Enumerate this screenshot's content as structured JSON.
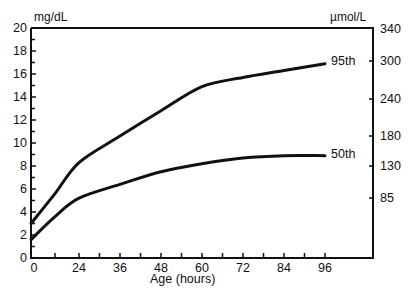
{
  "chart_data": {
    "type": "line",
    "title": "",
    "xlabel": "Age (hours)",
    "ylabel_left": "mg/dL",
    "ylabel_right": "µmol/L",
    "x_ticks": [
      0,
      24,
      36,
      48,
      60,
      72,
      84,
      96
    ],
    "y_ticks_left": [
      0,
      2,
      4,
      6,
      8,
      10,
      12,
      14,
      16,
      18,
      20
    ],
    "y_ticks_right": [
      85,
      130,
      180,
      240,
      300,
      340
    ],
    "ylim": [
      0,
      20
    ],
    "xlim": [
      0,
      96
    ],
    "grid": false,
    "legend": "inline labels at line ends",
    "x": [
      0,
      12,
      24,
      36,
      48,
      60,
      72,
      84,
      96
    ],
    "series": [
      {
        "name": "95th",
        "values": [
          3.0,
          5.6,
          8.3,
          10.6,
          12.8,
          14.9,
          15.7,
          16.3,
          16.9
        ]
      },
      {
        "name": "50th",
        "values": [
          1.6,
          3.6,
          5.2,
          6.4,
          7.5,
          8.2,
          8.7,
          8.9,
          8.9
        ]
      }
    ]
  },
  "labels": {
    "left_unit": "mg/dL",
    "right_unit": "µmol/L",
    "x_title": "Age (hours)",
    "series_95": "95th",
    "series_50": "50th"
  }
}
